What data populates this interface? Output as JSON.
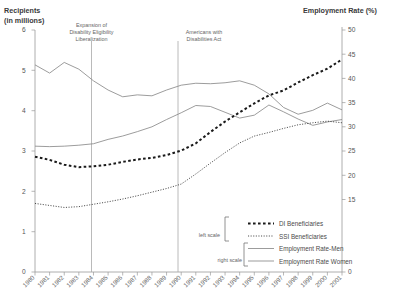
{
  "chart_data": {
    "type": "line",
    "title": "",
    "left_axis": {
      "label_line1": "Recipients",
      "label_line2": "(in millions)",
      "ticks": [
        "0",
        "1",
        "2",
        "3",
        "4",
        "5",
        "6"
      ],
      "ylim": [
        0,
        6
      ]
    },
    "right_axis": {
      "label": "Employment Rate (%)",
      "ticks": [
        "0",
        "15",
        "20",
        "25",
        "30",
        "35",
        "40",
        "45",
        "50"
      ],
      "ylim": [
        0,
        50
      ]
    },
    "xlabel": "",
    "x": [
      "1980",
      "1981",
      "1982",
      "1983",
      "1984",
      "1985",
      "1986",
      "1987",
      "1988",
      "1989",
      "1990",
      "1991",
      "1992",
      "1993",
      "1994",
      "1995",
      "1996",
      "1997",
      "1998",
      "1999",
      "2000",
      "2001"
    ],
    "grid": false,
    "legend_position": "bottom-right",
    "series": [
      {
        "name": "DI Beneficiaries",
        "scale": "left",
        "style": "thick-dashed",
        "values": [
          2.86,
          2.78,
          2.66,
          2.6,
          2.62,
          2.66,
          2.73,
          2.79,
          2.83,
          2.9,
          3.01,
          3.19,
          3.47,
          3.73,
          3.96,
          4.18,
          4.38,
          4.5,
          4.7,
          4.88,
          5.04,
          5.27
        ]
      },
      {
        "name": "SSI Beneficiaries",
        "scale": "left",
        "style": "dotted",
        "values": [
          1.7,
          1.65,
          1.6,
          1.62,
          1.68,
          1.74,
          1.81,
          1.89,
          1.98,
          2.07,
          2.18,
          2.43,
          2.7,
          2.96,
          3.2,
          3.37,
          3.46,
          3.56,
          3.65,
          3.7,
          3.74,
          3.7
        ]
      },
      {
        "name": "Employment Rate-Men",
        "scale": "right",
        "style": "solid",
        "values": [
          42.8,
          41.1,
          43.3,
          41.9,
          39.5,
          37.6,
          36.2,
          36.6,
          36.4,
          37.6,
          38.6,
          39.0,
          38.9,
          39.1,
          39.5,
          38.6,
          36.8,
          34.0,
          32.6,
          33.4,
          34.9,
          33.5
        ]
      },
      {
        "name": "Employment Rate Women",
        "scale": "right",
        "style": "solid",
        "values": [
          26.0,
          25.9,
          26.0,
          26.2,
          26.5,
          27.4,
          28.1,
          29.0,
          30.0,
          31.5,
          32.9,
          34.4,
          34.2,
          33.0,
          31.8,
          32.4,
          34.5,
          33.1,
          31.6,
          30.3,
          31.0,
          31.5
        ]
      }
    ],
    "annotations": [
      {
        "name": "expansion-of-disability-eligibility",
        "lines": [
          "Expansion of",
          "Disability Eligibility",
          "Liberalization"
        ],
        "x_year": "1984"
      },
      {
        "name": "americans-with-disabilities-act",
        "lines": [
          "Americans with",
          "Disabilities Act"
        ],
        "x_year": "1990"
      }
    ],
    "legend": {
      "left_scale_label": "left scale",
      "right_scale_label": "right scale",
      "entries": [
        {
          "label": "DI Beneficiaries",
          "style": "thick-dashed",
          "scale": "left"
        },
        {
          "label": "SSI Beneficiaries",
          "style": "dotted",
          "scale": "left"
        },
        {
          "label": "Employment Rate-Men",
          "style": "solid",
          "scale": "right"
        },
        {
          "label": "Employment Rate Women",
          "style": "solid",
          "scale": "right"
        }
      ]
    },
    "colors": {
      "background": "#ffffff",
      "axis": "#9a9a9a",
      "di": "#1a1a1a",
      "ssi": "#3a3a3a",
      "employment": "#8a8a8a",
      "text": "#4a4a4a"
    }
  }
}
